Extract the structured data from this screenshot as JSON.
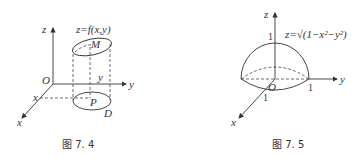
{
  "figures": [
    {
      "id": "fig-7-4",
      "caption": "图 7. 4",
      "axis_labels": {
        "z": "z",
        "y": "y",
        "x": "x",
        "origin": "O"
      },
      "surface_label": "z=f(x,y)",
      "point_labels": {
        "M": "M",
        "P": "P",
        "D": "D",
        "y_tick": "y",
        "x_tick": "x"
      }
    },
    {
      "id": "fig-7-5",
      "caption": "图 7. 5",
      "axis_labels": {
        "z": "z",
        "y": "y",
        "x": "x",
        "origin": "O"
      },
      "surface_label": "z=√(1−x²−y²)",
      "tick_labels": {
        "z_one": "1",
        "y_one": "1",
        "x_one": "1"
      }
    }
  ]
}
